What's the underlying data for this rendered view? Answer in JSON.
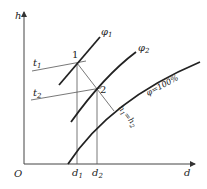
{
  "axes": {
    "y_label": "h",
    "x_label": "d",
    "origin_label": "O",
    "x_ticks": [
      {
        "label": "d",
        "sub": "1"
      },
      {
        "label": "d",
        "sub": "2"
      }
    ]
  },
  "curves": {
    "phi1": {
      "label": "φ",
      "sub": "1"
    },
    "phi2": {
      "label": "φ",
      "sub": "2"
    },
    "phi100": {
      "label": "φ=100%"
    }
  },
  "lines": {
    "t1": {
      "label": "t",
      "sub": "1"
    },
    "t2": {
      "label": "t",
      "sub": "2"
    },
    "isenthalpic": {
      "label": "h",
      "sub1": "1",
      "eq": "=h",
      "sub2": "2"
    }
  },
  "points": [
    {
      "label": "1"
    },
    {
      "label": "2"
    }
  ],
  "colors": {
    "line": "#222222",
    "thin": "#555555",
    "background": "#ffffff"
  }
}
